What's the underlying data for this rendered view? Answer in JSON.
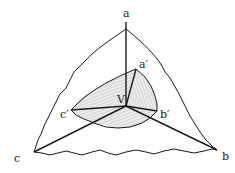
{
  "diagram": {
    "type": "trihedral-cone-with-section",
    "labels": {
      "a": "a",
      "b": "b",
      "c": "c",
      "a_prime": "a′",
      "b_prime": "b′",
      "c_prime": "c′",
      "vertex": "V"
    },
    "colors": {
      "stroke": "#1a1a1a",
      "shade": "#e4e4e4",
      "hatch": "#9a9a9a"
    }
  }
}
